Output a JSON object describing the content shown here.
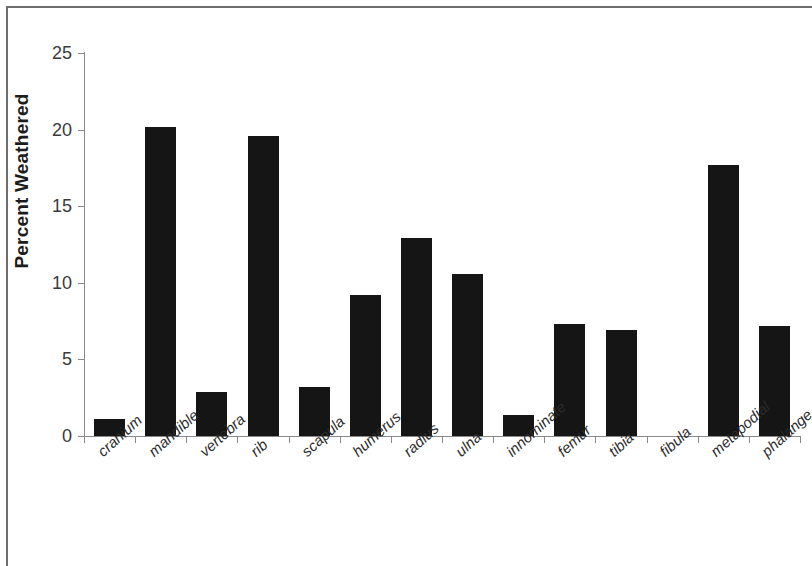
{
  "chart_data": {
    "type": "bar",
    "title": "",
    "subtitle": "",
    "xlabel": "",
    "ylabel": "Percent Weathered",
    "ylim": [
      0,
      25
    ],
    "ytick_labels": [
      "0",
      "5",
      "10",
      "15",
      "20",
      "25"
    ],
    "ytick_values": [
      0,
      5,
      10,
      15,
      20,
      25
    ],
    "grid": false,
    "legend": false,
    "bar_color": "#151515",
    "axis_color": "#8a8a8a",
    "categories": [
      "cranium",
      "mandible",
      "vertebra",
      "rib",
      "scapula",
      "humerus",
      "radius",
      "ulna",
      "innominate",
      "femur",
      "tibia",
      "fibula",
      "metapodial",
      "phalange"
    ],
    "values": [
      1.1,
      20.2,
      2.9,
      19.6,
      3.2,
      9.2,
      12.9,
      10.6,
      1.4,
      7.3,
      6.9,
      0.0,
      17.7,
      7.2
    ]
  }
}
